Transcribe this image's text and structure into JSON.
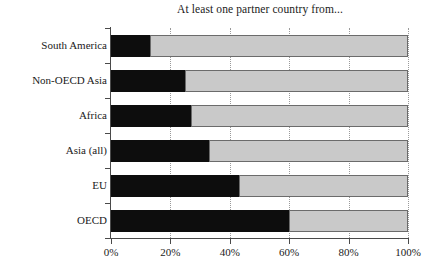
{
  "chart_data": {
    "type": "bar",
    "orientation": "horizontal",
    "stacked": true,
    "title": "At least one partner country from...",
    "xlabel": "",
    "ylabel": "",
    "xlim": [
      0,
      100
    ],
    "xticks": [
      0,
      20,
      40,
      60,
      80,
      100
    ],
    "xtick_labels": [
      "0%",
      "20%",
      "40%",
      "60%",
      "80%",
      "100%"
    ],
    "grid": "vertical-dotted",
    "legend": "none",
    "categories": [
      "South America",
      "Non-OECD Asia",
      "Africa",
      "Asia (all)",
      "EU",
      "OECD"
    ],
    "series": [
      {
        "name": "Yes",
        "color": "#0d0d0d",
        "values": [
          13,
          25,
          27,
          33,
          43,
          60
        ]
      },
      {
        "name": "No",
        "color": "#c9c9c9",
        "values": [
          87,
          75,
          73,
          67,
          57,
          40
        ]
      }
    ]
  },
  "axis": {
    "x_unit": "%",
    "y_tick_count": 7
  }
}
